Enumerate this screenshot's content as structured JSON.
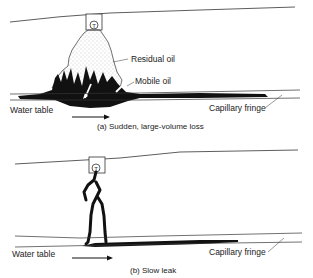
{
  "panel_a": {
    "caption": "(a) Sudden, large-volume loss",
    "labels": {
      "residual_oil": "Residual oil",
      "mobile_oil": "Mobile oil",
      "water_table": "Water table",
      "capillary_fringe": "Capillary fringe"
    },
    "tank_symbol": "T"
  },
  "panel_b": {
    "caption": "(b) Slow leak",
    "labels": {
      "water_table": "Water table",
      "capillary_fringe": "Capillary fringe"
    },
    "tank_symbol": "T"
  },
  "colors": {
    "ink": "#111111",
    "stipple": "#888888",
    "background": "#ffffff"
  }
}
